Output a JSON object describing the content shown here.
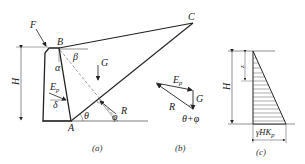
{
  "figure": {
    "panel_a": {
      "caption": "(a)",
      "points": {
        "A": "A",
        "B": "B",
        "C": "C",
        "F": "F"
      },
      "labels": {
        "height": "H",
        "weight": "G",
        "reaction": "R",
        "passive_force": "E",
        "passive_sub": "p",
        "alpha": "α",
        "beta": "β",
        "delta": "δ",
        "theta": "θ",
        "phi": "φ"
      }
    },
    "panel_b": {
      "caption": "(b)",
      "labels": {
        "passive_force": "E",
        "passive_sub": "p",
        "weight": "G",
        "reaction": "R",
        "angle": "θ+φ"
      }
    },
    "panel_c": {
      "caption": "(c)",
      "labels": {
        "height": "H",
        "depth": "z",
        "base_value_main": "γHK",
        "base_value_sub": "p"
      }
    }
  }
}
